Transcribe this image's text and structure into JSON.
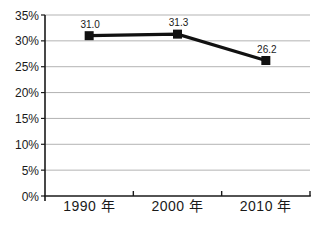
{
  "chart_data": {
    "type": "line",
    "categories": [
      "1990 年",
      "2000 年",
      "2010 年"
    ],
    "series": [
      {
        "name": "",
        "values": [
          31.0,
          31.3,
          26.2
        ],
        "color": "#111111",
        "marker": "square"
      }
    ],
    "data_labels": [
      "31.0",
      "31.3",
      "26.2"
    ],
    "title": "",
    "xlabel": "",
    "ylabel": "",
    "ylim": [
      0,
      35
    ],
    "ytick_step": 5,
    "ytick_labels": [
      "0%",
      "5%",
      "10%",
      "15%",
      "20%",
      "25%",
      "30%",
      "35%"
    ],
    "grid": true,
    "legend": "none"
  },
  "colors": {
    "background": "#ffffff",
    "gridline": "#b3b3b3",
    "axis": "#1a1a1a",
    "text": "#1a1a1a"
  }
}
